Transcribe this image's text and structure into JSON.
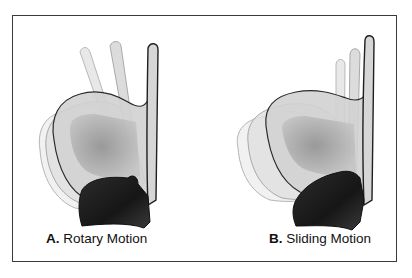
{
  "figure": {
    "panels": [
      {
        "id": "A",
        "letter": "A.",
        "label": "Rotary Motion"
      },
      {
        "id": "B",
        "letter": "B.",
        "label": "Sliding Motion"
      }
    ],
    "colors": {
      "frame": "#3a3a3a",
      "outline_dark": "#2a2a2a",
      "ghost_fill": "#e6e6e6",
      "mid_fill": "#a9a9a9",
      "dark_piece": "#1e1e1e"
    }
  }
}
